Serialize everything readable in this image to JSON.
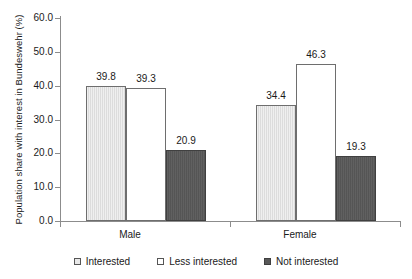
{
  "chart_data": {
    "type": "bar",
    "title": "",
    "subtitle": "",
    "xlabel": "",
    "ylabel": "Population share with interest in Bundeswehr (%)",
    "categories": [
      "Male",
      "Female"
    ],
    "series": [
      {
        "name": "Interested",
        "values": [
          39.8,
          34.4
        ],
        "color": "#dcdcdc"
      },
      {
        "name": "Less interested",
        "values": [
          39.3,
          46.3
        ],
        "color": "#ffffff"
      },
      {
        "name": "Not interested",
        "values": [
          20.9,
          19.3
        ],
        "color": "#585858"
      }
    ],
    "value_labels": [
      "39.8",
      "39.3",
      "20.9",
      "34.4",
      "46.3",
      "19.3"
    ],
    "ylim": [
      0.0,
      60.0
    ],
    "ytick_values": [
      0.0,
      10.0,
      20.0,
      30.0,
      40.0,
      50.0,
      60.0
    ],
    "ytick_labels": [
      "0.0",
      "10.0",
      "20.0",
      "30.0",
      "40.0",
      "50.0",
      "60.0"
    ],
    "grid": false,
    "legend_position": "bottom"
  },
  "axes": {
    "y_title": "Population share with interest in Bundeswehr (%)",
    "y_ticks": [
      {
        "label": "60.0",
        "value": 60.0
      },
      {
        "label": "50.0",
        "value": 50.0
      },
      {
        "label": "40.0",
        "value": 40.0
      },
      {
        "label": "30.0",
        "value": 30.0
      },
      {
        "label": "20.0",
        "value": 20.0
      },
      {
        "label": "10.0",
        "value": 10.0
      },
      {
        "label": "0.0",
        "value": 0.0
      }
    ],
    "x_categories": [
      {
        "label": "Male"
      },
      {
        "label": "Female"
      }
    ]
  },
  "bars": [
    {
      "group": "Male",
      "series": "Interested",
      "value": 39.8,
      "label": "39.8"
    },
    {
      "group": "Male",
      "series": "Less interested",
      "value": 39.3,
      "label": "39.3"
    },
    {
      "group": "Male",
      "series": "Not interested",
      "value": 20.9,
      "label": "20.9"
    },
    {
      "group": "Female",
      "series": "Interested",
      "value": 34.4,
      "label": "34.4"
    },
    {
      "group": "Female",
      "series": "Less interested",
      "value": 46.3,
      "label": "46.3"
    },
    {
      "group": "Female",
      "series": "Not interested",
      "value": 19.3,
      "label": "19.3"
    }
  ],
  "legend": {
    "items": [
      {
        "label": "Interested",
        "color": "#dcdcdc"
      },
      {
        "label": "Less interested",
        "color": "#ffffff"
      },
      {
        "label": "Not interested",
        "color": "#585858"
      }
    ]
  }
}
